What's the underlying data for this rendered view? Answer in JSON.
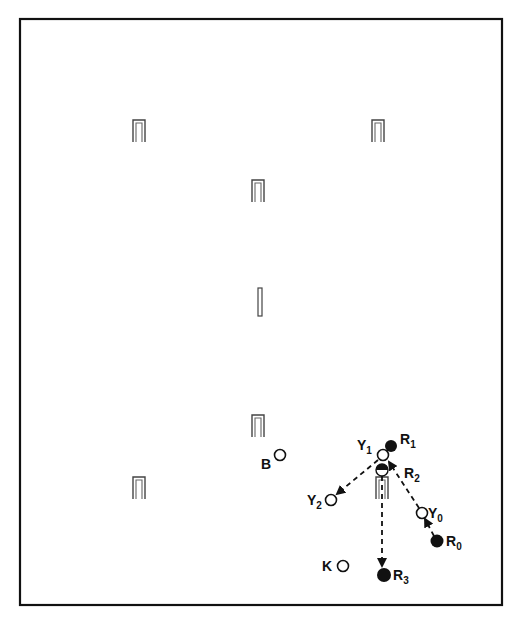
{
  "diagram": {
    "colors": {
      "ink": "#111111",
      "hoop": "#555555",
      "background": "#ffffff"
    },
    "court": {
      "x": 20,
      "y": 19,
      "width": 482,
      "height": 586
    },
    "hoops": [
      {
        "id": "hoop-1",
        "x": 139,
        "y": 130
      },
      {
        "id": "hoop-2",
        "x": 378,
        "y": 130
      },
      {
        "id": "hoop-3",
        "x": 258,
        "y": 190
      },
      {
        "id": "hoop-4",
        "x": 258,
        "y": 425
      },
      {
        "id": "hoop-5",
        "x": 139,
        "y": 487
      },
      {
        "id": "hoop-6",
        "x": 382,
        "y": 487
      }
    ],
    "peg": {
      "x": 260,
      "y": 302
    },
    "balls": [
      {
        "id": "B",
        "label": "B",
        "sub": "",
        "x": 280,
        "y": 455,
        "filled": false
      },
      {
        "id": "K",
        "label": "K",
        "sub": "",
        "x": 343,
        "y": 566,
        "filled": false
      },
      {
        "id": "Y0",
        "label": "Y",
        "sub": "0",
        "x": 422,
        "y": 513,
        "filled": false
      },
      {
        "id": "Y1",
        "label": "Y",
        "sub": "1",
        "x": 383,
        "y": 455,
        "filled": false
      },
      {
        "id": "Y2",
        "label": "Y",
        "sub": "2",
        "x": 331,
        "y": 500,
        "filled": false
      },
      {
        "id": "R0",
        "label": "R",
        "sub": "0",
        "x": 437,
        "y": 541,
        "filled": true
      },
      {
        "id": "R1",
        "label": "R",
        "sub": "1",
        "x": 391,
        "y": 446,
        "filled": true
      },
      {
        "id": "R2",
        "label": "R",
        "sub": "2",
        "x": 382,
        "y": 469,
        "filled": "half"
      },
      {
        "id": "R3",
        "label": "R",
        "sub": "3",
        "x": 384,
        "y": 575,
        "filled": true
      }
    ],
    "arrows": [
      {
        "from": "R0",
        "to": "Y0",
        "style": "dashed"
      },
      {
        "from": "Y0",
        "to": "Y1",
        "style": "dashed"
      },
      {
        "from": "Y1",
        "to": "Y2",
        "style": "dashed"
      },
      {
        "from": "R2",
        "to": "R3",
        "style": "dashed"
      }
    ],
    "labels": {
      "B": "B",
      "K": "K",
      "Y0": "Y",
      "Y0_sub": "0",
      "Y1": "Y",
      "Y1_sub": "1",
      "Y2": "Y",
      "Y2_sub": "2",
      "R0": "R",
      "R0_sub": "0",
      "R1": "R",
      "R1_sub": "1",
      "R2": "R",
      "R2_sub": "2",
      "R3": "R",
      "R3_sub": "3"
    }
  }
}
